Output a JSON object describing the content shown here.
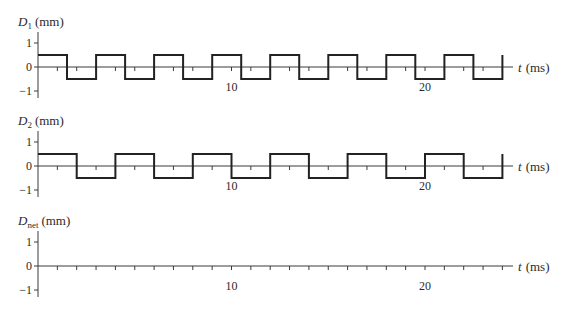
{
  "chart_data": [
    {
      "type": "line",
      "title": "",
      "ylabel": "D_1 (mm)",
      "ylabel_main": "D",
      "ylabel_sub": "1",
      "ylabel_unit": "(mm)",
      "xlabel": "t (ms)",
      "xlabel_var": "t",
      "xlabel_unit": "(ms)",
      "ylim": [
        -1,
        1
      ],
      "xlim": [
        0,
        24
      ],
      "yticks": [
        1,
        0,
        -1
      ],
      "ytick_labels": [
        "1",
        "0",
        "−1"
      ],
      "xtick_labels": [
        {
          "t": 10,
          "label": "10"
        },
        {
          "t": 20,
          "label": "20"
        }
      ],
      "minor_xtick_step": 1,
      "grid": false,
      "waveform": "square",
      "amplitude": 0.5,
      "period_ms": 3,
      "x": [
        0,
        1.5,
        1.5,
        3,
        3,
        4.5,
        4.5,
        6,
        6,
        7.5,
        7.5,
        9,
        9,
        10.5,
        10.5,
        12,
        12,
        13.5,
        13.5,
        15,
        15,
        16.5,
        16.5,
        18,
        18,
        19.5,
        19.5,
        21,
        21,
        22.5,
        22.5,
        24,
        24
      ],
      "y": [
        0.5,
        0.5,
        -0.5,
        -0.5,
        0.5,
        0.5,
        -0.5,
        -0.5,
        0.5,
        0.5,
        -0.5,
        -0.5,
        0.5,
        0.5,
        -0.5,
        -0.5,
        0.5,
        0.5,
        -0.5,
        -0.5,
        0.5,
        0.5,
        -0.5,
        -0.5,
        0.5,
        0.5,
        -0.5,
        -0.5,
        0.5,
        0.5,
        -0.5,
        -0.5,
        0.5
      ]
    },
    {
      "type": "line",
      "title": "",
      "ylabel": "D_2 (mm)",
      "ylabel_main": "D",
      "ylabel_sub": "2",
      "ylabel_unit": "(mm)",
      "xlabel": "t (ms)",
      "xlabel_var": "t",
      "xlabel_unit": "(ms)",
      "ylim": [
        -1,
        1
      ],
      "xlim": [
        0,
        24
      ],
      "yticks": [
        1,
        0,
        -1
      ],
      "ytick_labels": [
        "1",
        "0",
        "−1"
      ],
      "xtick_labels": [
        {
          "t": 10,
          "label": "10"
        },
        {
          "t": 20,
          "label": "20"
        }
      ],
      "minor_xtick_step": 1,
      "grid": false,
      "waveform": "square",
      "amplitude": 0.5,
      "period_ms": 4,
      "x": [
        0,
        2,
        2,
        4,
        4,
        6,
        6,
        8,
        8,
        10,
        10,
        12,
        12,
        14,
        14,
        16,
        16,
        18,
        18,
        20,
        20,
        22,
        22,
        24,
        24
      ],
      "y": [
        0.5,
        0.5,
        -0.5,
        -0.5,
        0.5,
        0.5,
        -0.5,
        -0.5,
        0.5,
        0.5,
        -0.5,
        -0.5,
        0.5,
        0.5,
        -0.5,
        -0.5,
        0.5,
        0.5,
        -0.5,
        -0.5,
        0.5,
        0.5,
        -0.5,
        -0.5,
        0.5
      ]
    },
    {
      "type": "line",
      "title": "",
      "ylabel": "D_net (mm)",
      "ylabel_main": "D",
      "ylabel_sub": "net",
      "ylabel_unit": "(mm)",
      "xlabel": "t (ms)",
      "xlabel_var": "t",
      "xlabel_unit": "(ms)",
      "ylim": [
        -1,
        1
      ],
      "xlim": [
        0,
        24
      ],
      "yticks": [
        1,
        0,
        -1
      ],
      "ytick_labels": [
        "1",
        "0",
        "−1"
      ],
      "xtick_labels": [
        {
          "t": 10,
          "label": "10"
        },
        {
          "t": 20,
          "label": "20"
        }
      ],
      "minor_xtick_step": 1,
      "grid": false,
      "waveform": "none",
      "note": "blank axes (no curve drawn)",
      "x": [],
      "y": []
    }
  ],
  "layout": {
    "x0_px": 38,
    "px_per_ms": 19.35,
    "px_per_mm": 24,
    "axis_end_px": 513,
    "minor_ticks": 24,
    "panels": [
      {
        "zero_y": 67,
        "label_y": 26,
        "axis_top": 32,
        "axis_bottom": 98
      },
      {
        "zero_y": 166,
        "label_y": 125,
        "axis_top": 131,
        "axis_bottom": 197
      },
      {
        "zero_y": 266,
        "label_y": 225,
        "axis_top": 231,
        "axis_bottom": 297
      }
    ]
  }
}
